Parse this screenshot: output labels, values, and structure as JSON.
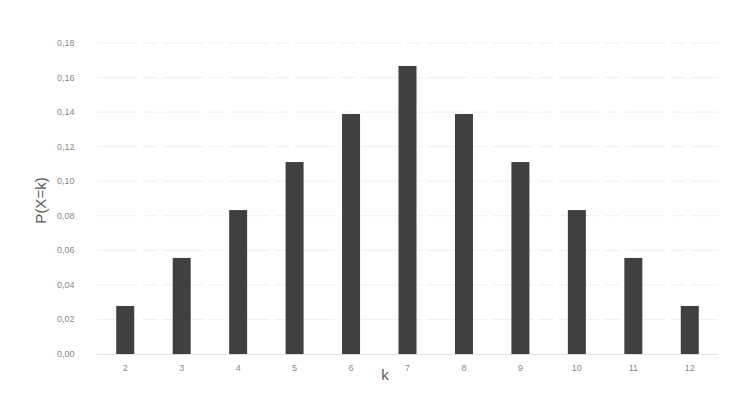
{
  "chart_data": {
    "type": "bar",
    "title": "",
    "xlabel": "k",
    "ylabel": "P(X=k)",
    "categories": [
      "2",
      "3",
      "4",
      "5",
      "6",
      "7",
      "8",
      "9",
      "10",
      "11",
      "12"
    ],
    "values": [
      0.0278,
      0.0556,
      0.0833,
      0.1111,
      0.1389,
      0.1667,
      0.1389,
      0.1111,
      0.0833,
      0.0556,
      0.0278
    ],
    "ylim": [
      0,
      0.18
    ],
    "yticks": [
      0,
      0.02,
      0.04,
      0.06,
      0.08,
      0.1,
      0.12,
      0.14,
      0.16,
      0.18
    ],
    "ytick_labels": [
      "0,00",
      "0,02",
      "0,04",
      "0,06",
      "0,08",
      "0,10",
      "0,12",
      "0,14",
      "0,16",
      "0,18"
    ],
    "grid": true,
    "legend": null,
    "bar_color": "#404040",
    "grid_color": "#efefef"
  }
}
